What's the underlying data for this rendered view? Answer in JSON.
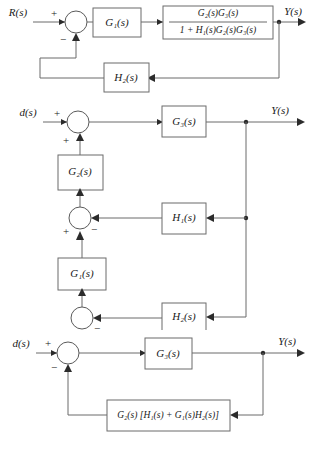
{
  "figure": {
    "type": "control-block-diagram",
    "line_color": "#6b6b6b",
    "text_color": "#1a1a1a",
    "background": "#ffffff"
  },
  "diagram1": {
    "input_label": "R(s)",
    "output_label": "Y(s)",
    "sum1": {
      "sign_top": "+",
      "sign_bottom": "−"
    },
    "block_g1": "G₁(s)",
    "block_closed_loop": {
      "numerator": "G₂(s)G₃(s)",
      "denominator": "1 + H₁(s)G₂(s)G₃(s)"
    },
    "block_h2": "H₂(s)"
  },
  "diagram2": {
    "input_label": "d(s)",
    "output_label": "Y(s)",
    "sum_top": {
      "sign_left": "+",
      "sign_bottom": "+"
    },
    "sum_mid": {
      "sign_bottom": "+",
      "sign_right": "−"
    },
    "sum_bottom": {
      "sign_right": "−"
    },
    "block_g3": "G₃(s)",
    "block_g2": "G₂(s)",
    "block_g1": "G₁(s)",
    "block_h1": "H₁(s)",
    "block_h2": "H₂(s)"
  },
  "diagram3": {
    "input_label": "d(s)",
    "output_label": "Y(s)",
    "sum": {
      "sign_top": "+",
      "sign_bottom": "−"
    },
    "block_g3": "G₃(s)",
    "block_feedback": "G₂(s) [H₁(s) + G₁(s)H₂(s)]"
  }
}
